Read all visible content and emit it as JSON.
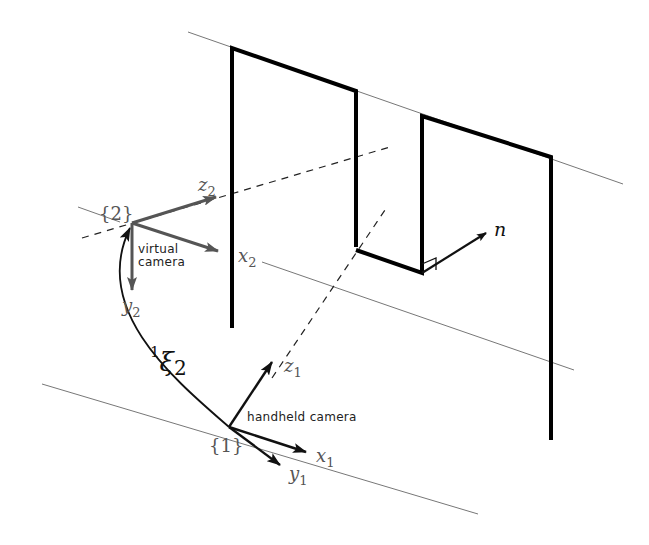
{
  "diagram": {
    "type": "3d-geometry-schematic",
    "frames": {
      "virtual": {
        "label": "{2}",
        "caption_line1": "virtual",
        "caption_line2": "camera",
        "axes": {
          "x": "x",
          "x_sub": "2",
          "y": "y",
          "y_sub": "2",
          "z": "z",
          "z_sub": "2"
        }
      },
      "handheld": {
        "label": "{1}",
        "caption": "handheld camera",
        "axes": {
          "x": "x",
          "x_sub": "1",
          "y": "y",
          "y_sub": "1",
          "z": "z",
          "z_sub": "1"
        }
      }
    },
    "transform": {
      "sup": "1",
      "symbol": "ξ",
      "sub": "2"
    },
    "normal_label": "n",
    "colors": {
      "lines": "#000000",
      "thin": "#777777",
      "axes_grey": "#555555"
    }
  }
}
